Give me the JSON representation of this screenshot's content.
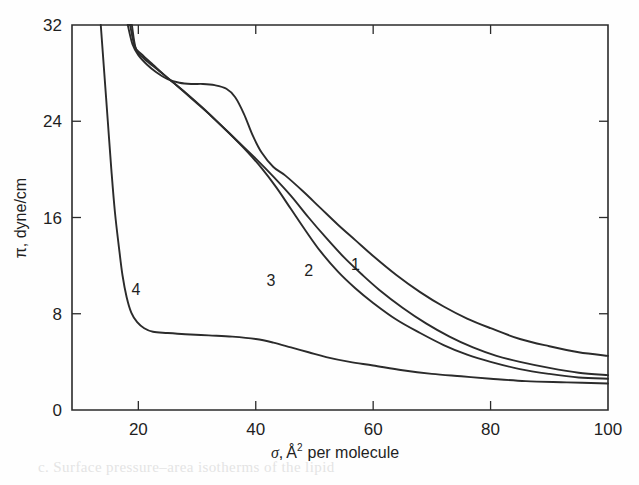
{
  "figure": {
    "background_color": "#ffffff",
    "ink_color": "#2b2b2b",
    "bleed_text": "c. Surface pressure–area isotherms of the lipid"
  },
  "axes": {
    "x": {
      "title_symbol": "σ",
      "title_sep": ",",
      "title_unit": "Å",
      "title_exponent": "2",
      "title_rest": "per molecule",
      "full_title": "σ, Å² per molecule",
      "ticks": [
        "20",
        "40",
        "60",
        "80",
        "100"
      ],
      "tick_values": [
        20,
        40,
        60,
        80,
        100
      ],
      "range": [
        8.7,
        100
      ]
    },
    "y": {
      "title": "π, dyne/cm",
      "ticks": [
        "0",
        "8",
        "16",
        "24",
        "32"
      ],
      "tick_values": [
        0,
        8,
        16,
        24,
        32
      ],
      "range": [
        0,
        32
      ]
    }
  },
  "curve_labels": [
    {
      "text": "1",
      "x": 57.0,
      "y": 11.6
    },
    {
      "text": "2",
      "x": 49.0,
      "y": 11.1
    },
    {
      "text": "3",
      "x": 42.6,
      "y": 10.3
    },
    {
      "text": "4",
      "x": 19.6,
      "y": 9.6
    }
  ],
  "chart_data": {
    "type": "line",
    "title": "",
    "xlabel": "σ, Å² per molecule",
    "ylabel": "π, dyne/cm",
    "xlim": [
      8.7,
      100
    ],
    "ylim": [
      0,
      32
    ],
    "grid": false,
    "legend": "inline-curve-numbers",
    "x_ticks": [
      20,
      40,
      60,
      80,
      100
    ],
    "y_ticks": [
      0,
      8,
      16,
      24,
      32
    ],
    "series": [
      {
        "name": "1",
        "label_position": {
          "x": 57.0,
          "y": 11.6
        },
        "points": [
          [
            18.2,
            32.0
          ],
          [
            19.0,
            30.4
          ],
          [
            20.0,
            29.5
          ],
          [
            21.5,
            28.7
          ],
          [
            23.0,
            28.1
          ],
          [
            25.0,
            27.5
          ],
          [
            27.0,
            27.2
          ],
          [
            29.0,
            27.1
          ],
          [
            31.0,
            27.1
          ],
          [
            33.0,
            27.0
          ],
          [
            35.0,
            26.7
          ],
          [
            36.5,
            26.0
          ],
          [
            38.0,
            24.6
          ],
          [
            39.5,
            22.8
          ],
          [
            41.0,
            21.4
          ],
          [
            43.0,
            20.2
          ],
          [
            45.0,
            19.5
          ],
          [
            48.0,
            18.2
          ],
          [
            51.0,
            16.8
          ],
          [
            54.0,
            15.4
          ],
          [
            57.0,
            14.1
          ],
          [
            60.0,
            12.8
          ],
          [
            64.0,
            11.2
          ],
          [
            68.0,
            9.8
          ],
          [
            72.0,
            8.6
          ],
          [
            76.0,
            7.6
          ],
          [
            80.0,
            6.8
          ],
          [
            85.0,
            5.9
          ],
          [
            90.0,
            5.3
          ],
          [
            95.0,
            4.8
          ],
          [
            100.0,
            4.5
          ]
        ]
      },
      {
        "name": "2",
        "label_position": {
          "x": 49.0,
          "y": 11.1
        },
        "points": [
          [
            18.6,
            32.0
          ],
          [
            19.4,
            30.2
          ],
          [
            20.5,
            29.6
          ],
          [
            22.5,
            28.7
          ],
          [
            25.0,
            27.6
          ],
          [
            28.0,
            26.4
          ],
          [
            31.0,
            25.1
          ],
          [
            34.0,
            23.7
          ],
          [
            37.0,
            22.3
          ],
          [
            40.0,
            20.9
          ],
          [
            43.0,
            19.4
          ],
          [
            46.0,
            17.8
          ],
          [
            49.0,
            16.0
          ],
          [
            52.0,
            14.3
          ],
          [
            55.0,
            12.7
          ],
          [
            58.0,
            11.3
          ],
          [
            61.0,
            10.0
          ],
          [
            65.0,
            8.5
          ],
          [
            69.0,
            7.2
          ],
          [
            73.0,
            6.1
          ],
          [
            77.0,
            5.2
          ],
          [
            81.0,
            4.5
          ],
          [
            85.0,
            4.0
          ],
          [
            90.0,
            3.5
          ],
          [
            95.0,
            3.1
          ],
          [
            100.0,
            2.9
          ]
        ]
      },
      {
        "name": "3",
        "label_position": {
          "x": 42.6,
          "y": 10.3
        },
        "points": [
          [
            18.9,
            32.0
          ],
          [
            19.6,
            30.0
          ],
          [
            21.0,
            29.2
          ],
          [
            23.5,
            28.2
          ],
          [
            26.5,
            27.0
          ],
          [
            29.5,
            25.7
          ],
          [
            32.5,
            24.4
          ],
          [
            35.5,
            23.0
          ],
          [
            38.5,
            21.5
          ],
          [
            41.0,
            20.1
          ],
          [
            43.5,
            18.5
          ],
          [
            46.0,
            16.7
          ],
          [
            48.5,
            14.9
          ],
          [
            51.0,
            13.2
          ],
          [
            54.0,
            11.5
          ],
          [
            57.0,
            10.1
          ],
          [
            60.0,
            8.9
          ],
          [
            64.0,
            7.5
          ],
          [
            68.0,
            6.4
          ],
          [
            72.0,
            5.4
          ],
          [
            76.0,
            4.6
          ],
          [
            80.0,
            4.0
          ],
          [
            85.0,
            3.4
          ],
          [
            90.0,
            3.0
          ],
          [
            95.0,
            2.7
          ],
          [
            100.0,
            2.6
          ]
        ]
      },
      {
        "name": "4",
        "label_position": {
          "x": 19.6,
          "y": 9.6
        },
        "points": [
          [
            13.6,
            32.0
          ],
          [
            14.2,
            28.0
          ],
          [
            14.8,
            24.0
          ],
          [
            15.4,
            20.0
          ],
          [
            16.0,
            16.5
          ],
          [
            16.7,
            13.5
          ],
          [
            17.3,
            11.2
          ],
          [
            18.0,
            9.4
          ],
          [
            18.8,
            8.1
          ],
          [
            19.8,
            7.3
          ],
          [
            21.0,
            6.8
          ],
          [
            22.5,
            6.5
          ],
          [
            25.0,
            6.4
          ],
          [
            28.0,
            6.3
          ],
          [
            32.0,
            6.2
          ],
          [
            36.0,
            6.1
          ],
          [
            40.0,
            5.9
          ],
          [
            43.0,
            5.6
          ],
          [
            46.0,
            5.2
          ],
          [
            49.0,
            4.8
          ],
          [
            52.0,
            4.4
          ],
          [
            56.0,
            4.0
          ],
          [
            60.0,
            3.7
          ],
          [
            65.0,
            3.3
          ],
          [
            70.0,
            3.0
          ],
          [
            75.0,
            2.8
          ],
          [
            80.0,
            2.6
          ],
          [
            86.0,
            2.4
          ],
          [
            93.0,
            2.3
          ],
          [
            100.0,
            2.2
          ]
        ]
      },
      {
        "name": "1-upper-tail",
        "label_position": null,
        "points": [
          [
            18.2,
            32.0
          ],
          [
            18.6,
            32.0
          ]
        ]
      }
    ]
  }
}
